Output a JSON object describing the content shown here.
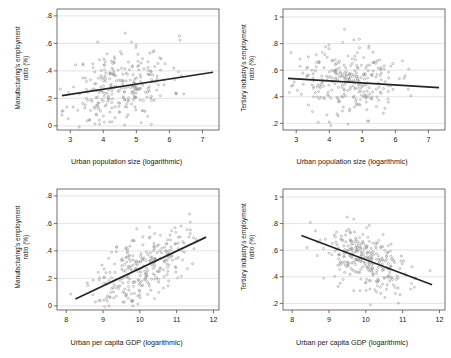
{
  "figure": {
    "background": "#ffffff",
    "point_color": "#9a9a9a",
    "line_color": "#262626",
    "grid_color": "#d9d9d9",
    "frame_color": "#4d4d4d",
    "panel_count": 4
  },
  "chart_data": [
    {
      "id": "panel-top-left",
      "type": "scatter",
      "title": "",
      "xlabel": "Urban population size (logarithmic)",
      "ylabel": "Manufacturing's employment\nratio (%)",
      "xlim": [
        2.6,
        7.5
      ],
      "ylim": [
        -0.03,
        0.85
      ],
      "xticks": [
        3,
        4,
        5,
        6,
        7
      ],
      "xticklabels": [
        "3",
        "4",
        "5",
        "6",
        "7"
      ],
      "yticks": [
        0,
        0.2,
        0.4,
        0.6,
        0.8
      ],
      "yticklabels": [
        "0",
        ".2",
        ".4",
        ".6",
        ".8"
      ],
      "grid": "horizontal",
      "legend": "none",
      "n_points": 290,
      "x_mean": 4.5,
      "x_sd": 0.78,
      "y_mean": 0.285,
      "y_sd": 0.145,
      "correlation": 0.27,
      "fit_line": {
        "x0": 2.75,
        "y0": 0.22,
        "x1": 7.32,
        "y1": 0.39
      },
      "seed": 11
    },
    {
      "id": "panel-top-right",
      "type": "scatter",
      "title": "",
      "xlabel": "Urban population size (logarithmic)",
      "ylabel": "Tertiary industry's employment\nratio (%)",
      "xlim": [
        2.6,
        7.5
      ],
      "ylim": [
        0.15,
        1.06
      ],
      "xticks": [
        3,
        4,
        5,
        6,
        7
      ],
      "xticklabels": [
        "3",
        "4",
        "5",
        "6",
        "7"
      ],
      "yticks": [
        0.2,
        0.4,
        0.6,
        0.8,
        1
      ],
      "yticklabels": [
        ".2",
        ".4",
        ".6",
        ".8",
        "1"
      ],
      "grid": "horizontal",
      "legend": "none",
      "n_points": 290,
      "x_mean": 4.5,
      "x_sd": 0.78,
      "y_mean": 0.515,
      "y_sd": 0.128,
      "correlation": -0.12,
      "fit_line": {
        "x0": 2.75,
        "y0": 0.538,
        "x1": 7.32,
        "y1": 0.468
      },
      "seed": 23
    },
    {
      "id": "panel-bottom-left",
      "type": "scatter",
      "title": "",
      "xlabel": "Urban per capita GDP (logarithmic)",
      "ylabel": "Manufacturing's employment\nratio (%)",
      "xlim": [
        7.75,
        12.15
      ],
      "ylim": [
        -0.03,
        0.85
      ],
      "xticks": [
        8,
        9,
        10,
        11,
        12
      ],
      "xticklabels": [
        "8",
        "9",
        "10",
        "11",
        "12"
      ],
      "yticks": [
        0,
        0.2,
        0.4,
        0.6,
        0.8
      ],
      "yticklabels": [
        "0",
        ".2",
        ".4",
        ".6",
        ".8"
      ],
      "grid": "horizontal",
      "legend": "none",
      "n_points": 290,
      "x_mean": 10.05,
      "x_sd": 0.62,
      "y_mean": 0.285,
      "y_sd": 0.145,
      "correlation": 0.55,
      "fit_line": {
        "x0": 8.25,
        "y0": 0.05,
        "x1": 11.8,
        "y1": 0.5
      },
      "seed": 37
    },
    {
      "id": "panel-bottom-right",
      "type": "scatter",
      "title": "",
      "xlabel": "Urban per capita GDP (logarithmic)",
      "ylabel": "Tertiary industry's employment\nratio (%)",
      "xlim": [
        7.75,
        12.15
      ],
      "ylim": [
        0.15,
        1.06
      ],
      "xticks": [
        8,
        9,
        10,
        11,
        12
      ],
      "xticklabels": [
        "8",
        "9",
        "10",
        "11",
        "12"
      ],
      "yticks": [
        0.2,
        0.4,
        0.6,
        0.8,
        1
      ],
      "yticklabels": [
        ".2",
        ".4",
        ".6",
        ".8",
        "1"
      ],
      "grid": "horizontal",
      "legend": "none",
      "n_points": 290,
      "x_mean": 10.05,
      "x_sd": 0.62,
      "y_mean": 0.515,
      "y_sd": 0.128,
      "correlation": -0.48,
      "fit_line": {
        "x0": 8.25,
        "y0": 0.71,
        "x1": 11.8,
        "y1": 0.34
      },
      "seed": 53
    }
  ]
}
